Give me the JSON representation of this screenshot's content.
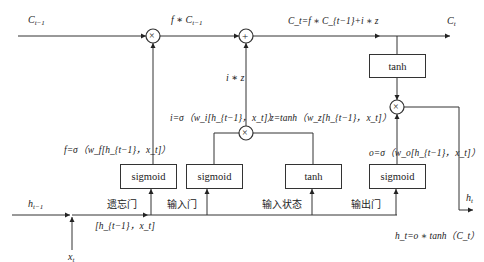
{
  "diagram": {
    "labels": {
      "c_prev": "C",
      "c_prev_sub": "t−1",
      "f_times_c": "f ∗ C",
      "f_times_c_sub": "t−1",
      "c_t_eq": "C_t=f ∗ C_{t−1}+i ∗ z",
      "c_t_out": "C",
      "c_t_out_sub": "t",
      "i_times_z": "i ∗ z",
      "f_eq": "f=σ（w_f[h_{t−1}，x_t]）",
      "i_eq": "i=σ（w_i[h_{t−1}，x_t]）",
      "z_eq": "z=tanh（w_z[h_{t−1}，x_t]）",
      "o_eq": "o=σ（w_o[h_{t−1}，x_t]）",
      "h_prev": "h",
      "h_prev_sub": "t−1",
      "x_t": "x",
      "x_t_sub": "t",
      "concat": "[h_{t−1}，x_t]",
      "h_t_out": "h",
      "h_t_out_sub": "t",
      "h_t_eq": "h_t=o ∗ tanh（C_t）"
    },
    "gate_names": {
      "forget": "遗忘门",
      "input": "输入门",
      "input_state": "输入状态",
      "output": "输出门"
    },
    "boxes": {
      "forget_sigmoid": "sigmoid",
      "input_sigmoid": "sigmoid",
      "state_tanh": "tanh",
      "output_sigmoid": "sigmoid",
      "cell_tanh": "tanh"
    },
    "operators": {
      "forget_mul": "×",
      "cell_add": "+",
      "input_mul": "×",
      "output_mul": "×"
    }
  }
}
